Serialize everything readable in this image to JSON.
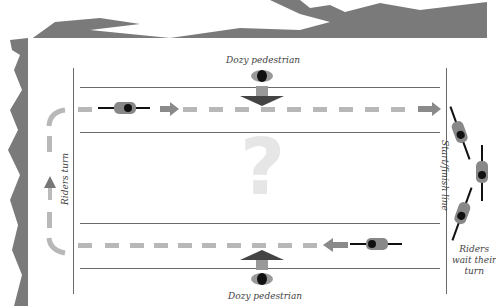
{
  "diagram": {
    "top_label": "Dozy pedestrian",
    "bottom_label": "Dozy pedestrian",
    "left_label": "Riders turn",
    "right_label": "Start/finish line",
    "wait_label_line1": "Riders",
    "wait_label_line2": "wait their",
    "wait_label_line3": "turn",
    "center_symbol": "?"
  },
  "colors": {
    "texture": "#7a7a7a",
    "lines": "#6a6a6a",
    "dashes": "#b8b8b8",
    "question": "#e6e6e6"
  }
}
